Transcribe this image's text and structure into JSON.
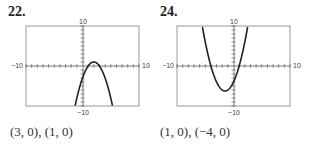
{
  "problems": [
    {
      "number": "22.",
      "answer": "(3, 0), (1, 0)",
      "window": {
        "xmin": -10,
        "xmax": 10,
        "ymin": -10,
        "ymax": 10
      },
      "labels": {
        "ymax": "10",
        "ymin": "−10",
        "xmin": "−10",
        "xmax": "10"
      }
    },
    {
      "number": "24.",
      "answer": "(1, 0), (−4, 0)",
      "window": {
        "xmin": -10,
        "xmax": 10,
        "ymin": -10,
        "ymax": 10
      },
      "labels": {
        "ymax": "10",
        "ymin": "−10",
        "xmin": "−10",
        "xmax": "10"
      }
    }
  ],
  "chart_data": [
    {
      "type": "line",
      "title": "22.",
      "function": "y = -(x-1)(x-3)",
      "x": [
        1.6,
        2,
        2.5,
        3,
        3.5,
        4,
        4.4
      ],
      "y": [
        -5.0,
        -3,
        -1.25,
        0,
        0.75,
        1,
        -5.0
      ],
      "xlim": [
        -10,
        10
      ],
      "ylim": [
        -10,
        10
      ],
      "grid": false,
      "annotations": [
        "(3, 0), (1, 0)"
      ]
    },
    {
      "type": "line",
      "title": "24.",
      "function": "y = (x-1)(x+4)",
      "x": [
        -4,
        -1.5,
        1
      ],
      "y": [
        0,
        -6.25,
        0
      ],
      "xlim": [
        -10,
        10
      ],
      "ylim": [
        -10,
        10
      ],
      "grid": false,
      "annotations": [
        "(1, 0), (−4, 0)"
      ]
    }
  ]
}
